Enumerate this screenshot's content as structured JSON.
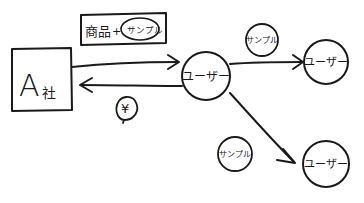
{
  "diagram": {
    "type": "flow",
    "style": "hand-drawn",
    "colors": {
      "ink": "#1a1a1a",
      "background": "#ffffff"
    },
    "nodes": {
      "company": {
        "label_main": "A",
        "label_sub": "社",
        "shape": "box"
      },
      "user_center": {
        "label": "ユーザー",
        "shape": "circle"
      },
      "user_top_right": {
        "label": "ユーザー",
        "shape": "circle"
      },
      "user_bottom_right": {
        "label": "ユーザー",
        "shape": "circle"
      }
    },
    "labels": {
      "goods_box": {
        "product": "商品",
        "plus": "+",
        "sample": "サンプル"
      },
      "yen": "¥",
      "sample_top": "サンプル",
      "sample_bottom": "サンプル"
    },
    "edges": [
      {
        "from": "company",
        "to": "user_center",
        "label": "商品+サンプル"
      },
      {
        "from": "user_center",
        "to": "company",
        "label": "¥"
      },
      {
        "from": "user_center",
        "to": "user_top_right",
        "label": "サンプル"
      },
      {
        "from": "user_center",
        "to": "user_bottom_right",
        "label": "サンプル"
      }
    ]
  }
}
